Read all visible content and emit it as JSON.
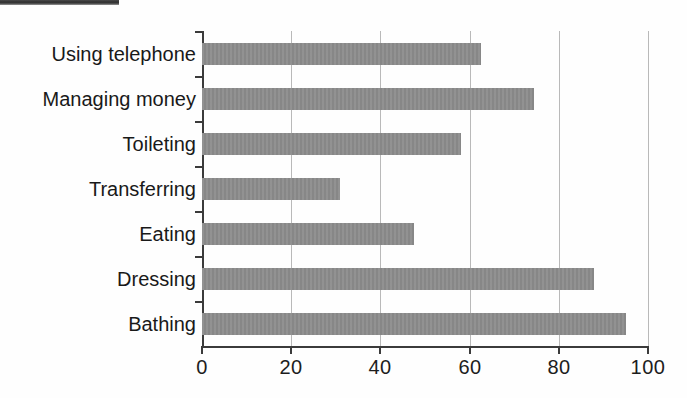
{
  "chart_data": {
    "type": "bar",
    "orientation": "horizontal",
    "title": "",
    "subtitle": "",
    "xlabel": "",
    "ylabel": "",
    "xlim": [
      0,
      100
    ],
    "xticks": [
      0,
      20,
      40,
      60,
      80,
      100
    ],
    "xticklabels": [
      "0",
      "20",
      "40",
      "60",
      "80",
      "100"
    ],
    "grid": "vertical",
    "legend": "none",
    "bar_color": "#8c8c8c",
    "axis_color": "#3b3b3b",
    "gridline_color": "#b9b9b9",
    "categories": [
      "Using telephone",
      "Managing money",
      "Toileting",
      "Transferring",
      "Eating",
      "Dressing",
      "Bathing"
    ],
    "values": [
      62.5,
      74.5,
      58,
      31,
      47.5,
      88,
      95
    ],
    "bars": [
      {
        "label": "Using telephone",
        "value": 62.5
      },
      {
        "label": "Managing money",
        "value": 74.5
      },
      {
        "label": "Toileting",
        "value": 58
      },
      {
        "label": "Transferring",
        "value": 31
      },
      {
        "label": "Eating",
        "value": 47.5
      },
      {
        "label": "Dressing",
        "value": 88
      },
      {
        "label": "Bathing",
        "value": 95
      }
    ]
  },
  "artifacts": {
    "scan_strip_color": "#2e2e2e"
  }
}
